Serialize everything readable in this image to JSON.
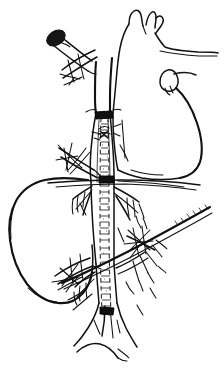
{
  "figure": {
    "domain": "Natural-Image",
    "title": "",
    "caption": "",
    "medium": "hand-drawn ink line drawing",
    "background_color": "#ffffff",
    "ink_color": "#111111",
    "width": 224,
    "height": 375,
    "has_text_labels": false,
    "label_text": ""
  },
  "structures": [
    {
      "id": "heart",
      "name": "heart-outline",
      "description": "heart silhouette with aortic arch branches, upper right of image",
      "region": "top-right"
    },
    {
      "id": "aortic-arch-branches",
      "name": "aortic-arch-branch-vessels",
      "description": "two short forked vessels rising from top of heart",
      "region": "top-center"
    },
    {
      "id": "atrial-appendage",
      "name": "atrial-appendage-lobe",
      "description": "small rounded lobe on the right border of the heart",
      "region": "right-upper"
    },
    {
      "id": "great-vessel",
      "name": "great-vessel-trunk",
      "description": "large vertical vessel (vena cava) running the full height of the drawing",
      "region": "center"
    },
    {
      "id": "stent-graft",
      "name": "stent-graft",
      "description": "textured tubular stent-graft inside the vessel with radiopaque bands at both ends",
      "region": "center"
    },
    {
      "id": "proximal-marker-band",
      "name": "proximal-marker-band",
      "description": "dark band marking the upper end of the stent-graft",
      "region": "center-upper"
    },
    {
      "id": "mid-marker-band",
      "name": "mid-marker-band",
      "description": "dark band at the mid portion of the stent-graft near the liver edge",
      "region": "center-middle"
    },
    {
      "id": "distal-marker-band",
      "name": "distal-marker-band",
      "description": "dark band marking the lower end of the stent-graft",
      "region": "center-lower"
    },
    {
      "id": "catheter",
      "name": "catheter-with-tip",
      "description": "angled catheter entering from upper left with a solid dark bullet tip",
      "region": "top-left"
    },
    {
      "id": "catheter-tip",
      "name": "catheter-tip",
      "description": "filled dark oval tip of the catheter",
      "region": "top-left"
    },
    {
      "id": "liver",
      "name": "liver-outline",
      "description": "large smooth lobed organ occupying the left half",
      "region": "left-middle"
    },
    {
      "id": "diaphragm-line",
      "name": "diaphragm-line",
      "description": "long horizontal line crossing behind the vessel at liver level",
      "region": "middle"
    },
    {
      "id": "oblique-band",
      "name": "oblique-retractor-band",
      "description": "long straight diagonal line sweeping from lower-left to upper-right",
      "region": "lower-right"
    },
    {
      "id": "renal-branches-left",
      "name": "renal-branch-vessels-left",
      "description": "small branching vessels radiating to the left of the trunk",
      "region": "center-left"
    },
    {
      "id": "renal-branches-right",
      "name": "renal-branch-vessels-right",
      "description": "small branching vessels radiating to the right of the trunk",
      "region": "center-right"
    },
    {
      "id": "iliac-bifurcation",
      "name": "iliac-bifurcation",
      "description": "vessel splitting into two limbs at the bottom of the drawing",
      "region": "bottom-center"
    },
    {
      "id": "suture-upper",
      "name": "suture-needle-upper",
      "description": "crossed needle and suture threads upper-left of the vessel",
      "region": "upper-left"
    },
    {
      "id": "suture-mid",
      "name": "suture-needle-mid",
      "description": "crossed needle and suture threads at mid vessel, left side",
      "region": "middle-left"
    },
    {
      "id": "suture-lower-left",
      "name": "suture-needle-lower-left",
      "description": "crossed needle and suture threads lower-left of the vessel",
      "region": "lower-left"
    },
    {
      "id": "suture-lower-right",
      "name": "suture-needle-lower-right",
      "description": "crossed needle and suture threads lower-right among branch vessels",
      "region": "lower-right"
    }
  ]
}
